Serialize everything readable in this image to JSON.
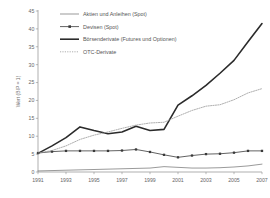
{
  "chart_data": {
    "type": "line",
    "title": "",
    "xlabel": "",
    "ylabel": "Wert (BIP = 1)",
    "xlim": [
      1991,
      2007
    ],
    "ylim": [
      0,
      45
    ],
    "ytick_step": 5,
    "grid": false,
    "legend_position": "top-center",
    "x": [
      1991,
      1992,
      1993,
      1994,
      1995,
      1996,
      1997,
      1998,
      1999,
      2000,
      2001,
      2002,
      2003,
      2004,
      2005,
      2006,
      2007
    ],
    "xtick_labels": [
      "1991",
      "1993",
      "1995",
      "1997",
      "1999",
      "2001",
      "2003",
      "2005",
      "2007"
    ],
    "ytick_labels": [
      "0",
      "5",
      "10",
      "15",
      "20",
      "25",
      "30",
      "35",
      "40",
      "45"
    ],
    "series": [
      {
        "name": "Aktien und Anleihen (Spot)",
        "style": "thin-solid",
        "color": "#6e6e6e",
        "marker": "none",
        "values": [
          0.3,
          0.4,
          0.5,
          0.6,
          0.7,
          0.8,
          0.9,
          1.0,
          1.1,
          1.5,
          1.3,
          1.1,
          1.1,
          1.2,
          1.4,
          1.7,
          2.2
        ]
      },
      {
        "name": "Devisen (Spot)",
        "style": "solid-markers",
        "color": "#3a3a3a",
        "marker": "square",
        "values": [
          5.3,
          5.7,
          5.9,
          5.9,
          5.9,
          5.9,
          6.0,
          6.3,
          5.6,
          4.8,
          4.1,
          4.6,
          5.0,
          5.1,
          5.4,
          5.9,
          5.9
        ]
      },
      {
        "name": "Börsenderivate (Futures und Optionen)",
        "style": "thick-solid",
        "color": "#2b2b2b",
        "marker": "none",
        "values": [
          5.2,
          7.3,
          9.6,
          12.6,
          11.6,
          10.7,
          11.2,
          12.8,
          11.6,
          11.9,
          18.7,
          21.3,
          24.2,
          27.6,
          31.2,
          36.4,
          41.5
        ]
      },
      {
        "name": "OTC-Derivate",
        "style": "dotted",
        "color": "#9a9a9a",
        "marker": "none",
        "values": [
          5.3,
          6.0,
          7.3,
          9.1,
          10.3,
          11.2,
          12.2,
          13.1,
          13.7,
          13.9,
          15.6,
          17.2,
          18.4,
          18.8,
          20.2,
          22.1,
          23.3
        ]
      }
    ]
  },
  "legend": {
    "items": [
      {
        "label": "Aktien und Anleihen (Spot)"
      },
      {
        "label": "Devisen (Spot)"
      },
      {
        "label": "Börsenderivate (Futures und Optionen)"
      },
      {
        "label": "OTC-Derivate"
      }
    ]
  },
  "axis": {
    "y_title": "Wert (BIP = 1)"
  }
}
